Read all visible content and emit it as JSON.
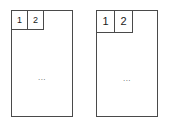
{
  "diagram": {
    "background_color": "#ffffff",
    "stroke_color": "#4a4a4a",
    "text_color": "#1a1a1a",
    "ellipsis_color": "#555555",
    "figures": [
      {
        "id": "figure-left",
        "label": "left-diagram",
        "cells": [
          {
            "label": "1"
          },
          {
            "label": "2"
          }
        ],
        "body_text": "..."
      },
      {
        "id": "figure-right",
        "label": "right-diagram",
        "cells": [
          {
            "label": "1"
          },
          {
            "label": "2"
          }
        ],
        "body_text": "..."
      }
    ]
  }
}
